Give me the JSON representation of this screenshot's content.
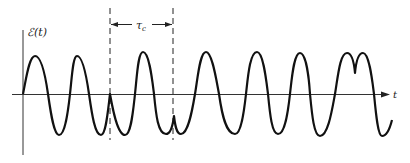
{
  "figure": {
    "y_axis_label": "ℰ(t)",
    "x_axis_label": "t",
    "interval_label": "τ",
    "interval_subscript": "c",
    "colors": {
      "background": "#ffffff",
      "curve": "#111111",
      "axes": "#333333",
      "dashed_lines": "#222222"
    }
  }
}
